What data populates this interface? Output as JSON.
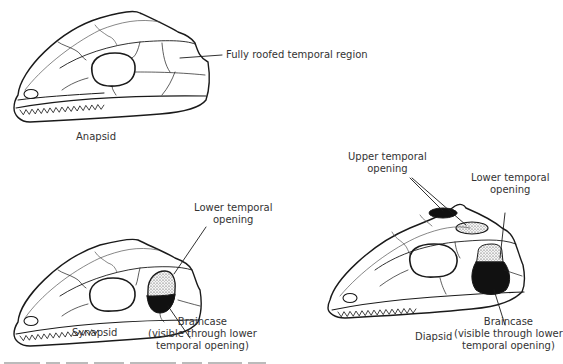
{
  "figure": {
    "panels": [
      {
        "name": "anapsid",
        "title": "Anapsid",
        "annotations": [
          "Fully roofed temporal region"
        ]
      },
      {
        "name": "synapsid",
        "title": "Synapsid",
        "annotations": [
          "Lower temporal\nopening",
          "Braincase\n(visible through lower\ntemporal opening)"
        ]
      },
      {
        "name": "diapsid",
        "title": "Diapsid",
        "annotations": [
          "Upper temporal\nopening",
          "Lower temporal\nopening",
          "Braincase\n(visible through lower\ntemporal opening)"
        ]
      }
    ],
    "labels": {
      "anapsid_title": "Anapsid",
      "anapsid_roof": "Fully roofed temporal region",
      "synapsid_title": "Synapsid",
      "synapsid_lower_1": "Lower temporal",
      "synapsid_lower_2": "opening",
      "synapsid_brain_1": "Braincase",
      "synapsid_brain_2": "(visible through lower",
      "synapsid_brain_3": "temporal opening)",
      "diapsid_title": "Diapsid",
      "diapsid_upper_1": "Upper temporal",
      "diapsid_upper_2": "opening",
      "diapsid_lower_1": "Lower temporal",
      "diapsid_lower_2": "opening",
      "diapsid_brain_1": "Braincase",
      "diapsid_brain_2": "(visible through lower",
      "diapsid_brain_3": "temporal opening)"
    }
  }
}
